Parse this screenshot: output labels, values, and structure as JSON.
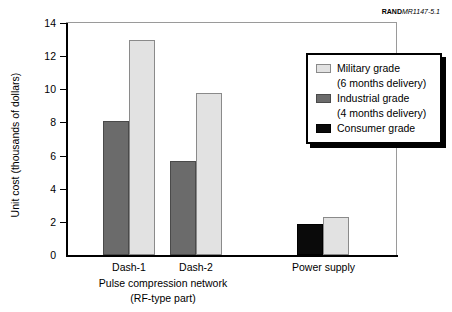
{
  "source_id": {
    "bold_part": "RAND",
    "italic_part": "MR1147-5.1"
  },
  "chart_data": {
    "type": "bar",
    "title": "",
    "xlabel": "",
    "ylabel": "Unit cost (thousands of dollars)",
    "ylim": [
      0,
      14
    ],
    "yticks": [
      0,
      2,
      4,
      6,
      8,
      10,
      12,
      14
    ],
    "ytick_labels": [
      "0",
      "2",
      "4",
      "6",
      "8",
      "10",
      "12",
      "14"
    ],
    "grid": false,
    "legend_position": "upper right",
    "categories": [
      "Dash-1",
      "Dash-2",
      "Power supply"
    ],
    "group_captions": [
      "Pulse compression network",
      "(RF-type part)"
    ],
    "series": [
      {
        "name": "Military grade",
        "sublabel": "(6 months delivery)",
        "color": "#e2e2e2",
        "values": [
          13.0,
          9.8,
          2.3
        ]
      },
      {
        "name": "Industrial grade",
        "sublabel": "(4 months delivery)",
        "color": "#6b6b6b",
        "values": [
          8.1,
          5.65,
          null
        ]
      },
      {
        "name": "Consumer grade",
        "sublabel": "",
        "color": "#0a0a0a",
        "values": [
          null,
          null,
          1.9
        ]
      }
    ],
    "bars": [
      {
        "group": "Dash-1",
        "series": "Industrial grade",
        "value": 8.1,
        "left": 103,
        "width": 26
      },
      {
        "group": "Dash-1",
        "series": "Military grade",
        "value": 13.0,
        "left": 129,
        "width": 26
      },
      {
        "group": "Dash-2",
        "series": "Industrial grade",
        "value": 5.65,
        "left": 170,
        "width": 26
      },
      {
        "group": "Dash-2",
        "series": "Military grade",
        "value": 9.8,
        "left": 196,
        "width": 26
      },
      {
        "group": "Power supply",
        "series": "Consumer grade",
        "value": 1.9,
        "left": 297,
        "width": 26
      },
      {
        "group": "Power supply",
        "series": "Military grade",
        "value": 2.3,
        "left": 323,
        "width": 26
      }
    ]
  },
  "axis": {
    "y_title": "Unit cost (thousands of dollars)",
    "y_tick_labels": [
      "14",
      "12",
      "10",
      "8",
      "6",
      "4",
      "2",
      "0"
    ]
  },
  "x_axis": {
    "groups": [
      {
        "label": "Dash-1",
        "center": 129
      },
      {
        "label": "Dash-2",
        "center": 196
      },
      {
        "label": "Power supply",
        "center": 323
      }
    ],
    "caption_line1": "Pulse compression network",
    "caption_line2": "(RF-type part)"
  },
  "legend": {
    "items": [
      {
        "label": "Military grade",
        "sublabel": "(6 months delivery)",
        "swatch": "military"
      },
      {
        "label": "Industrial grade",
        "sublabel": "(4 months delivery)",
        "swatch": "industrial"
      },
      {
        "label": "Consumer grade",
        "sublabel": "",
        "swatch": "consumer"
      }
    ]
  }
}
